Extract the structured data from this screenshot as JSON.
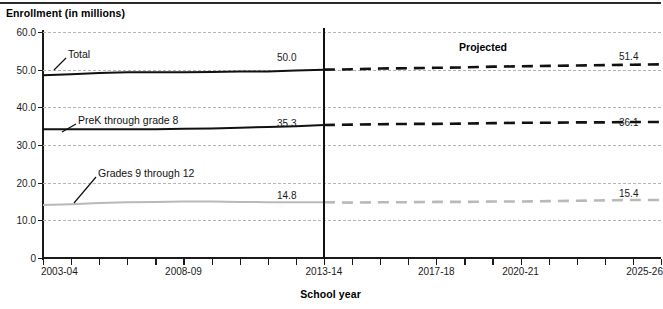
{
  "chart_data": {
    "type": "line",
    "title": "",
    "ylabel": "Enrollment (in millions)",
    "xlabel": "School year",
    "ylim": [
      0,
      60
    ],
    "y_ticks": [
      "0",
      "10.0",
      "20.0",
      "30.0",
      "40.0",
      "50.0",
      "60.0"
    ],
    "y_tick_values": [
      0,
      10,
      20,
      30,
      40,
      50,
      60
    ],
    "grid": true,
    "legend_position": "inline-callouts",
    "x_tick_labels": [
      "2003-04",
      "2008-09",
      "2013-14",
      "2017-18",
      "2020-21",
      "2025-26"
    ],
    "x_all_categories": [
      "2003-04",
      "2004-05",
      "2005-06",
      "2006-07",
      "2007-08",
      "2008-09",
      "2009-10",
      "2010-11",
      "2011-12",
      "2012-13",
      "2013-14",
      "2014-15",
      "2015-16",
      "2016-17",
      "2017-18",
      "2018-19",
      "2019-20",
      "2020-21",
      "2021-22",
      "2022-23",
      "2023-24",
      "2024-25",
      "2025-26"
    ],
    "projection_divider_category": "2013-14",
    "projected_annotation": "Projected",
    "series": [
      {
        "name": "Total",
        "color": "#111111",
        "values": [
          48.5,
          48.8,
          49.1,
          49.3,
          49.3,
          49.3,
          49.4,
          49.5,
          49.5,
          49.8,
          50.0,
          50.1,
          50.3,
          50.4,
          50.5,
          50.6,
          50.8,
          50.9,
          51.0,
          51.1,
          51.2,
          51.3,
          51.4
        ],
        "actual_end_label": "50.0",
        "projected_end_label": "51.4"
      },
      {
        "name": "PreK through grade 8",
        "color": "#111111",
        "values": [
          34.2,
          34.2,
          34.2,
          34.2,
          34.2,
          34.3,
          34.4,
          34.6,
          34.8,
          35.0,
          35.3,
          35.4,
          35.5,
          35.6,
          35.6,
          35.7,
          35.8,
          35.9,
          35.9,
          36.0,
          36.0,
          36.1,
          36.1
        ],
        "actual_end_label": "35.3",
        "projected_end_label": "36.1"
      },
      {
        "name": "Grades 9 through 12",
        "color": "#b9b9b9",
        "values": [
          14.1,
          14.3,
          14.6,
          14.8,
          14.9,
          15.0,
          15.0,
          14.9,
          14.8,
          14.8,
          14.8,
          14.7,
          14.8,
          14.8,
          14.9,
          14.9,
          15.0,
          15.0,
          15.1,
          15.2,
          15.3,
          15.4,
          15.4
        ],
        "actual_end_label": "14.8",
        "projected_end_label": "15.4"
      }
    ],
    "annotations": [
      {
        "text": "Total",
        "kind": "series-callout"
      },
      {
        "text": "PreK through grade 8",
        "kind": "series-callout"
      },
      {
        "text": "Grades 9 through 12",
        "kind": "series-callout"
      },
      {
        "text": "Projected",
        "kind": "region-label"
      }
    ]
  },
  "axis": {
    "y_title": "Enrollment (in millions)",
    "x_title": "School year",
    "y_ticks": [
      "60.0",
      "50.0",
      "40.0",
      "30.0",
      "20.0",
      "10.0",
      "0"
    ],
    "x_ticks": [
      "2003-04",
      "2008-09",
      "2013-14",
      "2017-18",
      "2020-21",
      "2025-26"
    ]
  },
  "labels": {
    "total": "Total",
    "prek": "PreK through grade 8",
    "grades": "Grades 9 through 12",
    "projected": "Projected",
    "total_mid": "50.0",
    "prek_mid": "35.3",
    "grades_mid": "14.8",
    "total_end": "51.4",
    "prek_end": "36.1",
    "grades_end": "15.4"
  }
}
